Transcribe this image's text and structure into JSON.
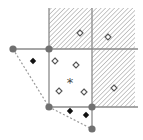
{
  "diagram": {
    "type": "grid-cells-with-points",
    "colors": {
      "line": "#8a8a8a",
      "hatch": "#9a9a9a",
      "vertex": "#707070",
      "filled_point": "#111111",
      "open_point_stroke": "#555555",
      "dashed_hull": "#9a9a9a"
    },
    "grid": {
      "vertical_lines": [
        {
          "x": 49,
          "y1": 8,
          "y2": 107
        },
        {
          "x": 92,
          "y1": 8,
          "y2": 130
        }
      ],
      "horizontal_lines": [
        {
          "y": 49,
          "x1": 13,
          "x2": 138
        },
        {
          "y": 107,
          "x1": 49,
          "x2": 138
        }
      ]
    },
    "hatched_regions": [
      {
        "x": 49,
        "y": 8,
        "w": 43,
        "h": 41
      },
      {
        "x": 92,
        "y": 8,
        "w": 43,
        "h": 41
      },
      {
        "x": 92,
        "y": 49,
        "w": 43,
        "h": 58
      }
    ],
    "vertices": [
      {
        "x": 13,
        "y": 49
      },
      {
        "x": 49,
        "y": 49
      },
      {
        "x": 49,
        "y": 107
      },
      {
        "x": 92,
        "y": 107
      },
      {
        "x": 92,
        "y": 129
      }
    ],
    "dashed_hull": [
      {
        "x": 13,
        "y": 49
      },
      {
        "x": 49,
        "y": 107
      },
      {
        "x": 92,
        "y": 129
      }
    ],
    "filled_diamonds": [
      {
        "x": 33,
        "y": 61
      },
      {
        "x": 70,
        "y": 111
      },
      {
        "x": 86,
        "y": 115
      }
    ],
    "open_diamonds": [
      {
        "x": 80,
        "y": 33
      },
      {
        "x": 108,
        "y": 37
      },
      {
        "x": 55,
        "y": 61
      },
      {
        "x": 76,
        "y": 65
      },
      {
        "x": 59,
        "y": 91
      },
      {
        "x": 84,
        "y": 92
      },
      {
        "x": 114,
        "y": 88
      }
    ],
    "asterisk": {
      "x": 70,
      "y": 82,
      "symbol": "*"
    }
  }
}
